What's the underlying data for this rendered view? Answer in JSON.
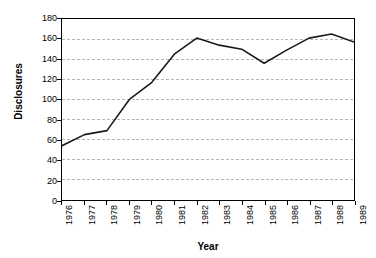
{
  "chart_data": {
    "type": "line",
    "title": "",
    "xlabel": "Year",
    "ylabel": "Disclosures",
    "categories": [
      "1976",
      "1977",
      "1978",
      "1979",
      "1980",
      "1981",
      "1982",
      "1983",
      "1984",
      "1985",
      "1986",
      "1987",
      "1988",
      "1989"
    ],
    "values": [
      54,
      65,
      69,
      100,
      117,
      145,
      161,
      154,
      150,
      136,
      149,
      161,
      165,
      157
    ],
    "series": [
      {
        "name": "Disclosures",
        "values": [
          54,
          65,
          69,
          100,
          117,
          145,
          161,
          154,
          150,
          136,
          149,
          161,
          165,
          157
        ]
      }
    ],
    "ylim": [
      0,
      180
    ],
    "y_ticks": [
      0,
      20,
      40,
      60,
      80,
      100,
      120,
      140,
      160,
      180
    ],
    "y_tick_labels": [
      "0",
      "20",
      "40",
      "60",
      "80",
      "100",
      "120",
      "140",
      "160",
      "180"
    ],
    "x_ticks": [
      "1976",
      "1977",
      "1978",
      "1979",
      "1980",
      "1981",
      "1982",
      "1983",
      "1984",
      "1985",
      "1986",
      "1987",
      "1988",
      "1989"
    ],
    "grid": "horizontal-dashed",
    "legend": "none",
    "line_color": "#1a1a1a",
    "grid_color": "#b4b4b4",
    "axis_color": "#000000",
    "background_color": "#ffffff"
  }
}
